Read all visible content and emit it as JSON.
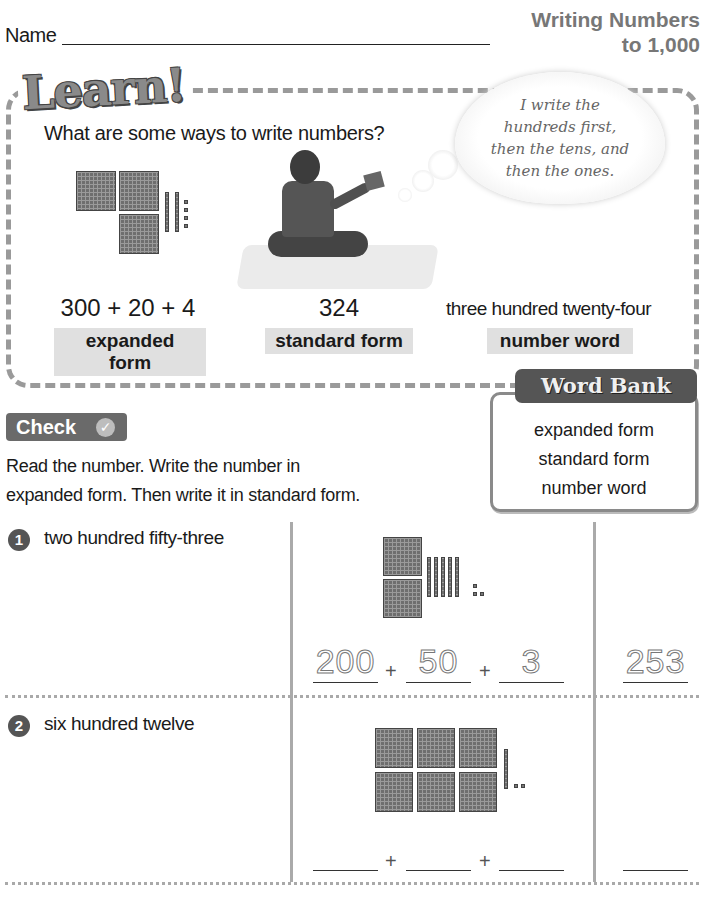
{
  "header": {
    "name_label": "Name",
    "title_line1": "Writing Numbers",
    "title_line2": "to 1,000"
  },
  "learn": {
    "logo": "Learn!",
    "question": "What are some ways to write numbers?",
    "thought_bubble": [
      "I write the",
      "hundreds first,",
      "then the tens, and",
      "then the ones."
    ],
    "model": {
      "hundreds": 3,
      "tens": 2,
      "ones": 4
    },
    "forms": [
      {
        "value": "300 + 20 + 4",
        "label": "expanded form"
      },
      {
        "value": "324",
        "label": "standard form"
      },
      {
        "value": "three hundred twenty-four",
        "label": "number word"
      }
    ]
  },
  "word_bank": {
    "title": "Word Bank",
    "items": [
      "expanded form",
      "standard form",
      "number word"
    ]
  },
  "check": {
    "label": "Check",
    "icon": "checkmark-icon",
    "instructions_line1": "Read the number. Write the number in",
    "instructions_line2": "expanded form. Then write it in standard form."
  },
  "problems": [
    {
      "number": "1",
      "words": "two hundred fifty-three",
      "model": {
        "hundreds": 2,
        "tens": 5,
        "ones": 3
      },
      "expanded": [
        "200",
        "50",
        "3"
      ],
      "plus": "+",
      "standard": "253"
    },
    {
      "number": "2",
      "words": "six hundred twelve",
      "model": {
        "hundreds": 6,
        "tens": 1,
        "ones": 2
      },
      "expanded": [
        "",
        "",
        ""
      ],
      "plus": "+",
      "standard": ""
    }
  ]
}
